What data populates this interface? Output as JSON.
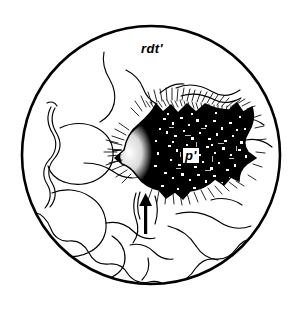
{
  "figure": {
    "kind": "scientific-line-drawing",
    "frame_shape": "circle",
    "background_color": "#ffffff",
    "ink_color": "#000000",
    "circle": {
      "cx": 151,
      "cy": 155,
      "r": 130,
      "stroke_width": 2.6
    },
    "labels": [
      {
        "id": "rdt",
        "text": "rdt'",
        "x": 141,
        "y": 42,
        "style": "bold-italic",
        "boxed": false
      },
      {
        "id": "p",
        "text": "p'",
        "x": 183,
        "y": 148,
        "style": "bold-italic",
        "boxed": true,
        "box_fill": "#ffffff"
      }
    ],
    "annotations": [
      {
        "id": "pointer-arrow",
        "type": "arrow",
        "direction": "up",
        "tail_x": 146,
        "tail_y": 232,
        "head_x": 146,
        "head_y": 196
      }
    ],
    "regions": [
      {
        "id": "dark-cavity",
        "description": "irregular dark stippled cavity",
        "fill": "#000000"
      },
      {
        "id": "fringe-hatching",
        "description": "radiating fine hatch lines around cavity rim"
      },
      {
        "id": "basal-hatched-band",
        "description": "diagonally hatched band along lower circle arc"
      },
      {
        "id": "contour-field",
        "description": "smooth contour outlines filling left half"
      }
    ]
  }
}
